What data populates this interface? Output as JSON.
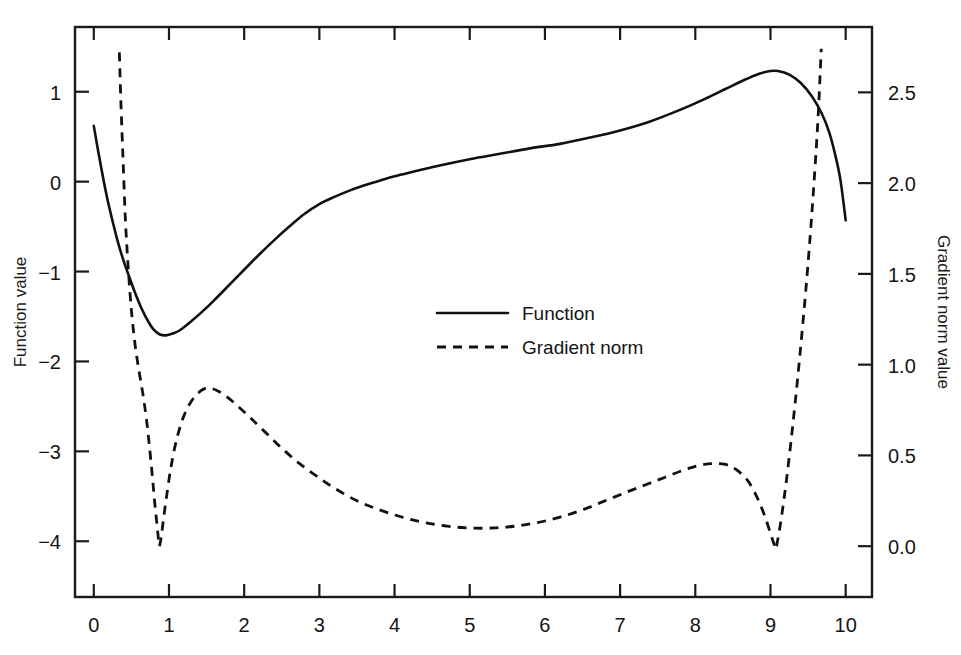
{
  "chart_data": {
    "type": "line",
    "title": "",
    "xlabel": "",
    "ylabel": "Function value",
    "y2label": "Gradient norm value",
    "xlim": [
      -0.25,
      10.35
    ],
    "ylim": [
      -4.62,
      1.72
    ],
    "y2lim": [
      -0.28,
      2.86
    ],
    "grid": false,
    "legend_position": "center",
    "x_ticks": [
      0,
      1,
      2,
      3,
      4,
      5,
      6,
      7,
      8,
      9,
      10
    ],
    "x_tick_labels": [
      "0",
      "1",
      "2",
      "3",
      "4",
      "5",
      "6",
      "7",
      "8",
      "9",
      "10"
    ],
    "y_ticks": [
      1,
      0,
      -1,
      -2,
      -3,
      -4
    ],
    "y_tick_labels": [
      "1",
      "0",
      "−1",
      "−2",
      "−3",
      "−4"
    ],
    "y2_ticks": [
      2.5,
      2.0,
      1.5,
      1.0,
      0.5,
      0.0
    ],
    "y2_tick_labels": [
      "2.5",
      "2.0",
      "1.5",
      "1.0",
      "0.5",
      "0.0"
    ],
    "series": [
      {
        "name": "Function",
        "axis": "left",
        "style": "solid",
        "points": [
          [
            0.0,
            0.62
          ],
          [
            0.06,
            0.33
          ],
          [
            0.12,
            0.06
          ],
          [
            0.18,
            -0.19
          ],
          [
            0.25,
            -0.44
          ],
          [
            0.32,
            -0.67
          ],
          [
            0.4,
            -0.89
          ],
          [
            0.48,
            -1.08
          ],
          [
            0.56,
            -1.26
          ],
          [
            0.64,
            -1.42
          ],
          [
            0.72,
            -1.55
          ],
          [
            0.8,
            -1.65
          ],
          [
            0.88,
            -1.7
          ],
          [
            0.96,
            -1.71
          ],
          [
            1.05,
            -1.69
          ],
          [
            1.15,
            -1.65
          ],
          [
            1.3,
            -1.55
          ],
          [
            1.45,
            -1.44
          ],
          [
            1.6,
            -1.32
          ],
          [
            1.8,
            -1.15
          ],
          [
            2.0,
            -0.98
          ],
          [
            2.2,
            -0.81
          ],
          [
            2.4,
            -0.65
          ],
          [
            2.6,
            -0.5
          ],
          [
            2.8,
            -0.36
          ],
          [
            3.0,
            -0.25
          ],
          [
            3.2,
            -0.17
          ],
          [
            3.4,
            -0.1
          ],
          [
            3.6,
            -0.04
          ],
          [
            3.8,
            0.01
          ],
          [
            4.0,
            0.06
          ],
          [
            4.3,
            0.12
          ],
          [
            4.6,
            0.18
          ],
          [
            5.0,
            0.25
          ],
          [
            5.4,
            0.31
          ],
          [
            5.8,
            0.37
          ],
          [
            6.2,
            0.42
          ],
          [
            6.6,
            0.49
          ],
          [
            7.0,
            0.57
          ],
          [
            7.4,
            0.67
          ],
          [
            7.8,
            0.8
          ],
          [
            8.1,
            0.91
          ],
          [
            8.4,
            1.03
          ],
          [
            8.65,
            1.13
          ],
          [
            8.85,
            1.2
          ],
          [
            9.0,
            1.23
          ],
          [
            9.1,
            1.23
          ],
          [
            9.25,
            1.19
          ],
          [
            9.4,
            1.1
          ],
          [
            9.55,
            0.95
          ],
          [
            9.68,
            0.76
          ],
          [
            9.78,
            0.55
          ],
          [
            9.86,
            0.3
          ],
          [
            9.93,
            0.02
          ],
          [
            10.0,
            -0.43
          ]
        ]
      },
      {
        "name": "Gradient norm",
        "axis": "right",
        "style": "dashed",
        "segments": [
          {
            "points": [
              [
                0.34,
                2.72
              ],
              [
                0.36,
                2.45
              ],
              [
                0.39,
                2.12
              ],
              [
                0.42,
                1.8
              ],
              [
                0.46,
                1.52
              ],
              [
                0.5,
                1.3
              ],
              [
                0.54,
                1.14
              ],
              [
                0.58,
                1.02
              ],
              [
                0.62,
                0.92
              ],
              [
                0.66,
                0.82
              ],
              [
                0.7,
                0.7
              ],
              [
                0.74,
                0.55
              ],
              [
                0.78,
                0.38
              ],
              [
                0.81,
                0.24
              ],
              [
                0.84,
                0.12
              ],
              [
                0.86,
                0.04
              ],
              [
                0.875,
                0.0
              ]
            ]
          },
          {
            "points": [
              [
                0.875,
                0.0
              ],
              [
                0.9,
                0.06
              ],
              [
                0.93,
                0.16
              ],
              [
                0.97,
                0.28
              ],
              [
                1.02,
                0.42
              ],
              [
                1.08,
                0.55
              ],
              [
                1.15,
                0.66
              ],
              [
                1.22,
                0.74
              ],
              [
                1.3,
                0.8
              ],
              [
                1.38,
                0.84
              ],
              [
                1.46,
                0.865
              ],
              [
                1.55,
                0.87
              ],
              [
                1.65,
                0.855
              ],
              [
                1.78,
                0.82
              ],
              [
                1.92,
                0.77
              ],
              [
                2.1,
                0.7
              ],
              [
                2.3,
                0.62
              ],
              [
                2.5,
                0.54
              ],
              [
                2.72,
                0.46
              ],
              [
                2.95,
                0.39
              ],
              [
                3.2,
                0.32
              ],
              [
                3.5,
                0.25
              ],
              [
                3.8,
                0.2
              ],
              [
                4.1,
                0.16
              ],
              [
                4.4,
                0.13
              ],
              [
                4.7,
                0.11
              ],
              [
                5.0,
                0.1
              ],
              [
                5.3,
                0.1
              ],
              [
                5.6,
                0.11
              ],
              [
                5.9,
                0.13
              ],
              [
                6.2,
                0.16
              ],
              [
                6.5,
                0.2
              ],
              [
                6.8,
                0.25
              ],
              [
                7.1,
                0.3
              ],
              [
                7.35,
                0.34
              ],
              [
                7.6,
                0.38
              ],
              [
                7.85,
                0.42
              ],
              [
                8.05,
                0.445
              ],
              [
                8.22,
                0.455
              ],
              [
                8.4,
                0.45
              ],
              [
                8.55,
                0.42
              ],
              [
                8.7,
                0.36
              ],
              [
                8.82,
                0.27
              ],
              [
                8.92,
                0.17
              ],
              [
                9.0,
                0.07
              ],
              [
                9.05,
                0.01
              ],
              [
                9.08,
                0.0
              ]
            ]
          },
          {
            "points": [
              [
                9.08,
                0.0
              ],
              [
                9.12,
                0.09
              ],
              [
                9.18,
                0.26
              ],
              [
                9.24,
                0.46
              ],
              [
                9.3,
                0.68
              ],
              [
                9.36,
                0.92
              ],
              [
                9.42,
                1.18
              ],
              [
                9.48,
                1.46
              ],
              [
                9.53,
                1.72
              ],
              [
                9.57,
                1.95
              ],
              [
                9.61,
                2.2
              ],
              [
                9.64,
                2.42
              ],
              [
                9.66,
                2.6
              ],
              [
                9.675,
                2.74
              ]
            ]
          }
        ]
      }
    ],
    "legend": [
      {
        "label": "Function",
        "style": "solid"
      },
      {
        "label": "Gradient norm",
        "style": "dashed"
      }
    ]
  },
  "colors": {
    "line": "#111111",
    "frame": "#1a1a1a",
    "background": "#ffffff"
  }
}
